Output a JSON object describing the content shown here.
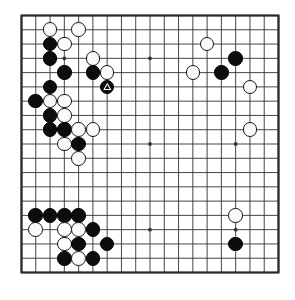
{
  "app": {
    "title": "Go Board Position",
    "board_type": "go-board",
    "size": 19
  },
  "board": {
    "line_color": "#33312f",
    "border_color": "#2b2927",
    "background_color": "#ffffff",
    "black_stone_color": "#0d0d0d",
    "white_stone_color": "#fbfbfb",
    "white_stone_edge_color": "#141414",
    "marker_color": "#ffffff",
    "columns": 19,
    "rows": 19,
    "star_points": [
      {
        "col": 4,
        "row": 4
      },
      {
        "col": 10,
        "row": 4
      },
      {
        "col": 16,
        "row": 4
      },
      {
        "col": 4,
        "row": 10
      },
      {
        "col": 10,
        "row": 10
      },
      {
        "col": 16,
        "row": 10
      },
      {
        "col": 4,
        "row": 16
      },
      {
        "col": 10,
        "row": 16
      },
      {
        "col": 16,
        "row": 16
      }
    ],
    "stones": [
      {
        "col": 3,
        "row": 2,
        "color": "white"
      },
      {
        "col": 5,
        "row": 2,
        "color": "white"
      },
      {
        "col": 3,
        "row": 3,
        "color": "black"
      },
      {
        "col": 4,
        "row": 3,
        "color": "white"
      },
      {
        "col": 14,
        "row": 3,
        "color": "white"
      },
      {
        "col": 3,
        "row": 4,
        "color": "black"
      },
      {
        "col": 6,
        "row": 4,
        "color": "white"
      },
      {
        "col": 16,
        "row": 4,
        "color": "black"
      },
      {
        "col": 4,
        "row": 5,
        "color": "black"
      },
      {
        "col": 6,
        "row": 5,
        "color": "black"
      },
      {
        "col": 7,
        "row": 5,
        "color": "white"
      },
      {
        "col": 13,
        "row": 5,
        "color": "white"
      },
      {
        "col": 15,
        "row": 5,
        "color": "black"
      },
      {
        "col": 3,
        "row": 6,
        "color": "black"
      },
      {
        "col": 7,
        "row": 6,
        "color": "black",
        "marker": "triangle"
      },
      {
        "col": 17,
        "row": 6,
        "color": "white"
      },
      {
        "col": 2,
        "row": 7,
        "color": "black"
      },
      {
        "col": 3,
        "row": 7,
        "color": "white"
      },
      {
        "col": 4,
        "row": 7,
        "color": "white"
      },
      {
        "col": 3,
        "row": 8,
        "color": "black"
      },
      {
        "col": 4,
        "row": 8,
        "color": "white"
      },
      {
        "col": 3,
        "row": 9,
        "color": "black"
      },
      {
        "col": 4,
        "row": 9,
        "color": "black"
      },
      {
        "col": 5,
        "row": 9,
        "color": "white"
      },
      {
        "col": 6,
        "row": 9,
        "color": "white"
      },
      {
        "col": 17,
        "row": 9,
        "color": "white"
      },
      {
        "col": 4,
        "row": 10,
        "color": "white"
      },
      {
        "col": 5,
        "row": 10,
        "color": "black"
      },
      {
        "col": 5,
        "row": 11,
        "color": "white"
      },
      {
        "col": 2,
        "row": 15,
        "color": "black"
      },
      {
        "col": 3,
        "row": 15,
        "color": "black"
      },
      {
        "col": 4,
        "row": 15,
        "color": "black"
      },
      {
        "col": 5,
        "row": 15,
        "color": "black"
      },
      {
        "col": 16,
        "row": 15,
        "color": "white"
      },
      {
        "col": 2,
        "row": 16,
        "color": "white"
      },
      {
        "col": 4,
        "row": 16,
        "color": "white"
      },
      {
        "col": 5,
        "row": 16,
        "color": "white"
      },
      {
        "col": 6,
        "row": 16,
        "color": "black"
      },
      {
        "col": 4,
        "row": 17,
        "color": "white"
      },
      {
        "col": 5,
        "row": 17,
        "color": "black"
      },
      {
        "col": 7,
        "row": 17,
        "color": "black"
      },
      {
        "col": 16,
        "row": 17,
        "color": "black"
      },
      {
        "col": 4,
        "row": 18,
        "color": "black"
      },
      {
        "col": 5,
        "row": 18,
        "color": "white"
      },
      {
        "col": 6,
        "row": 18,
        "color": "black"
      }
    ]
  }
}
